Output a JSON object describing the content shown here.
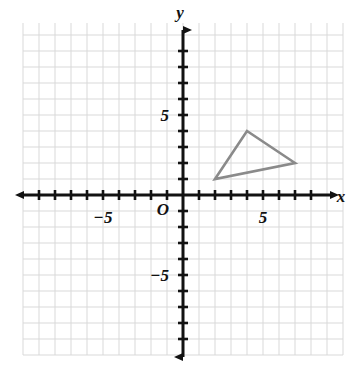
{
  "chart_data": {
    "type": "scatter",
    "title": "",
    "subtitle": "",
    "xlabel": "x",
    "ylabel": "y",
    "xlim": [
      -10,
      10
    ],
    "ylim": [
      -10,
      10
    ],
    "grid": true,
    "grid_step": 1,
    "legend": "none",
    "origin_label": "O",
    "x_tick_labels": [
      {
        "value": -5,
        "text": "−5"
      },
      {
        "value": 5,
        "text": "5"
      }
    ],
    "y_tick_labels": [
      {
        "value": 5,
        "text": "5"
      },
      {
        "value": -5,
        "text": "−5"
      }
    ],
    "shapes": [
      {
        "name": "triangle",
        "type": "polygon",
        "closed": true,
        "stroke": "#8a8a8a",
        "fill": "none",
        "stroke_width": 2.6,
        "points": [
          {
            "x": 2,
            "y": 1
          },
          {
            "x": 4,
            "y": 4
          },
          {
            "x": 7,
            "y": 2
          }
        ]
      }
    ],
    "annotations": [],
    "colors": {
      "grid": "#d9d9d9",
      "axis": "#121212",
      "shape_stroke": "#8a8a8a",
      "background": "#ffffff",
      "text": "#111111"
    }
  },
  "geometry": {
    "origin_px": {
      "x": 183,
      "y": 195
    },
    "unit_px": 16,
    "grid_bounds_px": {
      "left": 23,
      "top": 23,
      "right": 343,
      "bottom": 355
    },
    "axis_extent_px": {
      "x_left": 24,
      "x_right": 330,
      "y_top": 30,
      "y_bottom": 357
    }
  }
}
